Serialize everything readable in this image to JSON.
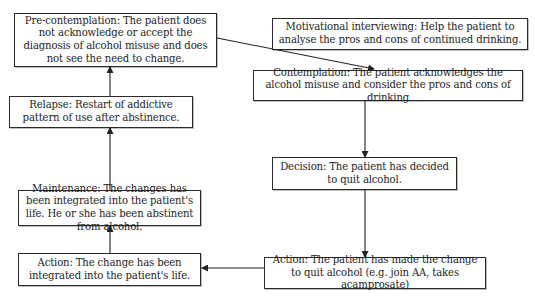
{
  "diagram": {
    "type": "stages-of-change-cycle",
    "colors": {
      "border": "#2a2a2a",
      "text": "#1e1e1e",
      "background": "#ffffff",
      "arrow": "#222222"
    },
    "nodes": {
      "precontemplation": {
        "id": "precontemplation",
        "text": "Pre-contemplation: The patient does not acknowledge or accept the diagnosis of alcohol misuse and does not see the need to change."
      },
      "motivational": {
        "id": "motivational",
        "text": "Motivational interviewing: Help the patient to analyse the pros and cons of continued drinking."
      },
      "contemplation": {
        "id": "contemplation",
        "text": "Contemplation: The patient acknowledges the alcohol misuse and consider the pros and cons of drinking"
      },
      "relapse": {
        "id": "relapse",
        "text": "Relapse: Restart of addictive pattern of use after abstinence."
      },
      "decision": {
        "id": "decision",
        "text": "Decision: The patient has decided to quit alcohol."
      },
      "maintenance": {
        "id": "maintenance",
        "text": "Maintenance: The changes has been integrated into the patient's life. He or she has been abstinent from alcohol."
      },
      "action_left": {
        "id": "action_left",
        "text": "Action: The change has been integrated into the patient's life."
      },
      "action_right": {
        "id": "action_right",
        "text": "Action: The patient has made the change to quit alcohol (e.g. join AA, takes acamprosate)"
      }
    },
    "edges": [
      {
        "from": "precontemplation",
        "to": "contemplation"
      },
      {
        "from": "contemplation",
        "to": "decision"
      },
      {
        "from": "decision",
        "to": "action_right"
      },
      {
        "from": "action_right",
        "to": "action_left"
      },
      {
        "from": "action_left",
        "to": "maintenance"
      },
      {
        "from": "maintenance",
        "to": "relapse"
      },
      {
        "from": "relapse",
        "to": "precontemplation"
      }
    ]
  }
}
